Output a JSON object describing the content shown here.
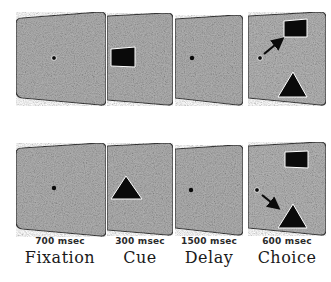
{
  "figure": {
    "colors": {
      "panel_fill": "#a8a8a8",
      "panel_border": "#3a3a3a",
      "stimulus": "#0a0a0a",
      "background": "#ffffff"
    },
    "epochs": [
      {
        "name": "Fixation",
        "duration": "700 msec"
      },
      {
        "name": "Cue",
        "duration": "300 msec"
      },
      {
        "name": "Delay",
        "duration": "1500 msec"
      },
      {
        "name": "Choice",
        "duration": "600 msec"
      }
    ],
    "trials": [
      {
        "row": "top",
        "cue_stimulus": "square",
        "choice_targets": [
          "square (upper right)",
          "triangle (lower right)"
        ],
        "saccade_target": "square"
      },
      {
        "row": "bottom",
        "cue_stimulus": "triangle",
        "choice_targets": [
          "square (upper right)",
          "triangle (lower right)"
        ],
        "saccade_target": "triangle"
      }
    ]
  }
}
